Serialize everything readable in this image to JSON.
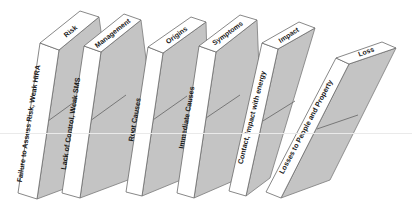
{
  "diagram": {
    "dominoes": [
      {
        "top_label": "Risk",
        "front_label": "Failure to Assess Risk, Weak HIRA"
      },
      {
        "top_label": "Management",
        "front_label": "Lack of Control, Weak SMS"
      },
      {
        "top_label": "Origins",
        "front_label": "Root Causes"
      },
      {
        "top_label": "Symptoms",
        "front_label": "Immediate Causes"
      },
      {
        "top_label": "Impact",
        "front_label": "Contact, impact with energy"
      },
      {
        "top_label": "Loss",
        "front_label": "Losses to People and Property"
      }
    ],
    "colors": {
      "face_white": "#ffffff",
      "side_gray": "#c4c4c4",
      "outline": "#6a6a6a"
    }
  }
}
